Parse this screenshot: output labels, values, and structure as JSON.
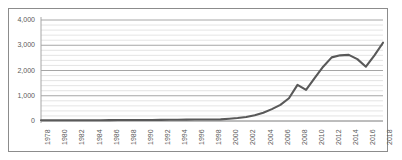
{
  "top_caption": "",
  "chart_data": {
    "type": "line",
    "title": "",
    "subtitle": "",
    "xlabel": "",
    "ylabel": "",
    "xlim": [
      1978,
      2018
    ],
    "ylim": [
      0,
      4000
    ],
    "y_major_step": 1000,
    "y_minor_step": 200,
    "grid": true,
    "legend": false,
    "legend_position": "none",
    "line_color": "#595959",
    "gridline_color_major": "#a6a6a6",
    "gridline_color_minor": "#d9d9d9",
    "border_color": "#8c8c8c",
    "ytick_labels": [
      "0",
      "1,000",
      "2,000",
      "3,000",
      "4,000"
    ],
    "ytick_values": [
      0,
      1000,
      2000,
      3000,
      4000
    ],
    "xtick_labels": [
      "1978",
      "1980",
      "1982",
      "1984",
      "1986",
      "1988",
      "1990",
      "1992",
      "1994",
      "1996",
      "1998",
      "2000",
      "2002",
      "2004",
      "2006",
      "2008",
      "2010",
      "2012",
      "2014",
      "2016",
      "2018"
    ],
    "x": [
      1978,
      1979,
      1980,
      1981,
      1982,
      1983,
      1984,
      1985,
      1986,
      1987,
      1988,
      1989,
      1990,
      1991,
      1992,
      1993,
      1994,
      1995,
      1996,
      1997,
      1998,
      1999,
      2000,
      2001,
      2002,
      2003,
      2004,
      2005,
      2006,
      2007,
      2008,
      2009,
      2010,
      2011,
      2012,
      2013,
      2014,
      2015,
      2016,
      2017,
      2018
    ],
    "values": [
      30,
      30,
      32,
      32,
      30,
      28,
      28,
      32,
      35,
      38,
      40,
      38,
      40,
      42,
      45,
      48,
      52,
      55,
      58,
      60,
      62,
      65,
      90,
      120,
      160,
      230,
      330,
      470,
      640,
      900,
      1430,
      1230,
      1700,
      2150,
      2520,
      2600,
      2620,
      2450,
      2150,
      2600,
      3100
    ],
    "series": [
      {
        "name": "series-1",
        "values": [
          30,
          30,
          32,
          32,
          30,
          28,
          28,
          32,
          35,
          38,
          40,
          38,
          40,
          42,
          45,
          48,
          52,
          55,
          58,
          60,
          62,
          65,
          90,
          120,
          160,
          230,
          330,
          470,
          640,
          900,
          1430,
          1230,
          1700,
          2150,
          2520,
          2600,
          2620,
          2450,
          2150,
          2600,
          3100
        ]
      }
    ]
  }
}
